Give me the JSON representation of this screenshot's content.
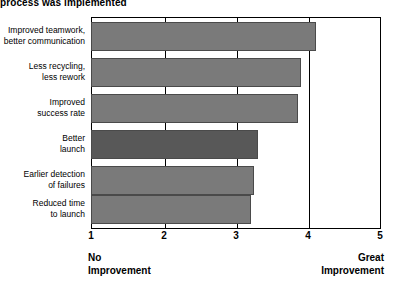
{
  "chart_data": {
    "type": "bar",
    "orientation": "horizontal",
    "title": "process was implemented",
    "xlabel": "",
    "ylabel": "",
    "xlim": [
      1,
      5
    ],
    "xticks": [
      1,
      2,
      3,
      4,
      5
    ],
    "xtick_labels": [
      "1",
      "2",
      "3",
      "4",
      "5"
    ],
    "grid": true,
    "gridlines_at": [
      2,
      3,
      4
    ],
    "legend": false,
    "scale_anchor_low": "No Improvement",
    "scale_anchor_low_lines": [
      "No",
      "Improvement"
    ],
    "scale_anchor_high": "Great Improvement",
    "scale_anchor_high_lines": [
      "Great",
      "Improvement"
    ],
    "categories": [
      "Improved teamwork, better communication",
      "Less recycling, less rework",
      "Improved success rate",
      "Better launch",
      "Earlier detection of failures",
      "Reduced time to launch"
    ],
    "category_lines": [
      [
        "Improved teamwork,",
        "better communication"
      ],
      [
        "Less recycling,",
        "less rework"
      ],
      [
        "Improved",
        "success rate"
      ],
      [
        "Better",
        "launch"
      ],
      [
        "Earlier detection",
        "of failures"
      ],
      [
        "Reduced time",
        "to launch"
      ]
    ],
    "values": [
      4.1,
      3.9,
      3.85,
      3.3,
      3.25,
      3.2
    ],
    "bar_colors": [
      "#7a7a7a",
      "#7a7a7a",
      "#7a7a7a",
      "#585858",
      "#7a7a7a",
      "#7a7a7a"
    ],
    "highlighted_index": 3
  },
  "colors": {
    "bar_default": "#7a7a7a",
    "bar_highlight": "#585858",
    "bar_edge": "#4a4a4a",
    "axis": "#000000",
    "background": "#ffffff"
  }
}
